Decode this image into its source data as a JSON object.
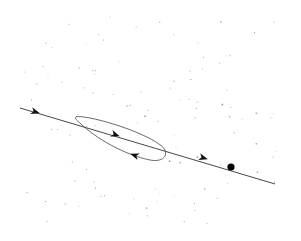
{
  "diagram": {
    "type": "trajectory",
    "colors": {
      "line": "#222222",
      "marker": "#000000",
      "speckle": "#888888",
      "background": "#ffffff"
    },
    "arrows": [
      {
        "name": "arrow-entry",
        "direction": "right-down"
      },
      {
        "name": "arrow-loop-forward",
        "direction": "right-down"
      },
      {
        "name": "arrow-loop-return",
        "direction": "left-up"
      },
      {
        "name": "arrow-exit",
        "direction": "right-down"
      }
    ],
    "end_marker": "filled-circle"
  }
}
